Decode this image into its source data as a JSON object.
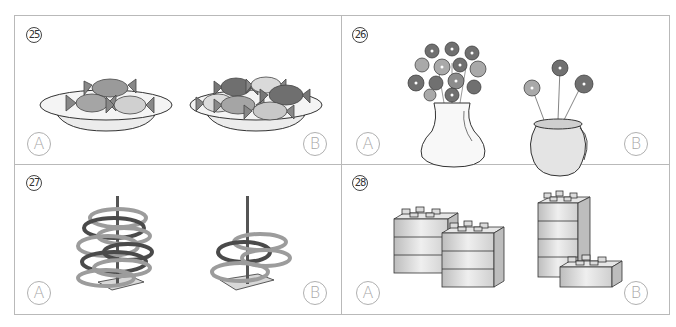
{
  "worksheet": {
    "type": "picture comparison exercise",
    "questions": [
      {
        "number": "㉕",
        "number_value": 25,
        "subject": "candies on a plate",
        "options": [
          {
            "label": "A",
            "description": "plate with 3 wrapped candies"
          },
          {
            "label": "B",
            "description": "plate with 5 wrapped candies"
          }
        ]
      },
      {
        "number": "㉖",
        "number_value": 26,
        "subject": "flowers in a vase",
        "options": [
          {
            "label": "A",
            "description": "wide vase with many flowers"
          },
          {
            "label": "B",
            "description": "jug vase with 3 flowers"
          }
        ]
      },
      {
        "number": "㉗",
        "number_value": 27,
        "subject": "rings on a ring-toss stand",
        "options": [
          {
            "label": "A",
            "description": "stand with many rings"
          },
          {
            "label": "B",
            "description": "stand with few rings"
          }
        ]
      },
      {
        "number": "㉘",
        "number_value": 28,
        "subject": "stacked toy blocks",
        "options": [
          {
            "label": "A",
            "description": "two stacks of 3 blocks (6 blocks)"
          },
          {
            "label": "B",
            "description": "one stack of 4 blocks plus 1 block (5 blocks)"
          }
        ]
      }
    ]
  },
  "colors": {
    "border": "#b9b9b9",
    "label_gray": "#a8a8a8",
    "candy_dark": "#6f6f6f",
    "candy_mid": "#9a9a9a",
    "candy_light": "#c8c8c8",
    "flower_dark": "#707070",
    "flower_light": "#a9a9a9",
    "ring_dark": "#4a4a4a",
    "ring_light": "#9c9c9c",
    "block": "#d7d7d7"
  }
}
